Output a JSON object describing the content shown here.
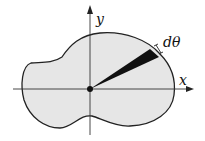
{
  "diagram": {
    "labels": {
      "x_axis": "x",
      "y_axis": "y",
      "wedge_angle": "dθ"
    },
    "colors": {
      "region_fill": "#e6e6e6",
      "outline": "#222222",
      "wedge": "#111111",
      "background": "#ffffff"
    }
  }
}
